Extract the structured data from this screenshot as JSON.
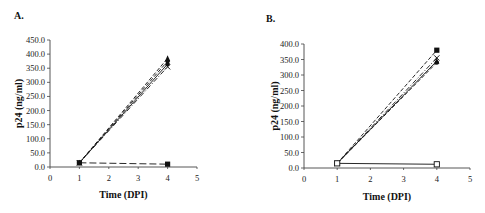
{
  "chart_data": [
    {
      "panel": "A.",
      "type": "line",
      "title": "",
      "xlabel": "Time (DPI)",
      "ylabel": "p24 (ng/ml)",
      "xlim": [
        0,
        5
      ],
      "ylim": [
        0,
        450
      ],
      "xticks": [
        "0",
        "1",
        "2",
        "3",
        "4",
        "5"
      ],
      "yticks": [
        "0.0",
        "50.0",
        "100.0",
        "150.0",
        "200.0",
        "250.0",
        "300.0",
        "350.0",
        "400.0",
        "450.0"
      ],
      "grid": false,
      "legend": null,
      "x": [
        1,
        4
      ],
      "series": [
        {
          "name": "series-1",
          "marker": "triangle-filled",
          "line": "dashed",
          "values": [
            15,
            385
          ]
        },
        {
          "name": "series-2",
          "marker": "diamond-filled",
          "line": "dashed",
          "values": [
            15,
            375
          ]
        },
        {
          "name": "series-3",
          "marker": "circle-filled",
          "line": "solid",
          "values": [
            15,
            365
          ]
        },
        {
          "name": "series-4",
          "marker": "x",
          "line": "dash-dot",
          "values": [
            15,
            355
          ]
        },
        {
          "name": "series-5",
          "marker": "square-filled",
          "line": "long-dash",
          "values": [
            15,
            10
          ]
        }
      ]
    },
    {
      "panel": "B.",
      "type": "line",
      "title": "",
      "xlabel": "Time (DPI)",
      "ylabel": "p24 (ng/ml)",
      "xlim": [
        0,
        5
      ],
      "ylim": [
        0,
        400
      ],
      "xticks": [
        "0",
        "1",
        "2",
        "3",
        "4",
        "5"
      ],
      "yticks": [
        "0.0",
        "50.0",
        "100.0",
        "150.0",
        "200.0",
        "250.0",
        "300.0",
        "350.0",
        "400.0"
      ],
      "grid": false,
      "legend": null,
      "x": [
        1,
        4
      ],
      "series": [
        {
          "name": "series-1",
          "marker": "square-filled",
          "line": "dashed",
          "values": [
            15,
            380
          ]
        },
        {
          "name": "series-2",
          "marker": "x",
          "line": "dash-dot",
          "values": [
            15,
            355
          ]
        },
        {
          "name": "series-3",
          "marker": "triangle-filled",
          "line": "solid",
          "values": [
            15,
            345
          ]
        },
        {
          "name": "series-4",
          "marker": "circle-filled",
          "line": "dashed",
          "values": [
            15,
            340
          ]
        },
        {
          "name": "series-5",
          "marker": "square-open",
          "line": "solid",
          "values": [
            15,
            12
          ]
        }
      ]
    }
  ]
}
